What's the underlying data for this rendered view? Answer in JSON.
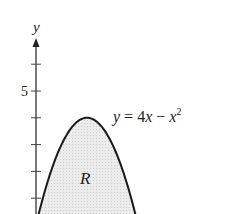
{
  "chart_data": {
    "type": "area",
    "title": "",
    "xlabel": "",
    "ylabel": "y",
    "function": "y = 4x - x^2",
    "curve_label": "y = 4x − x²",
    "region_label": "R",
    "x": [
      0,
      0.5,
      1,
      1.5,
      2,
      2.5,
      3,
      3.5,
      4
    ],
    "y": [
      0,
      1.75,
      3,
      3.75,
      4,
      3.75,
      3,
      1.75,
      0
    ],
    "y_ticks": [
      1,
      2,
      3,
      4,
      5,
      6
    ],
    "y_tick_labels": [
      {
        "value": 5,
        "label": "5"
      }
    ],
    "ylim": [
      0,
      6.5
    ],
    "xlim": [
      0,
      4
    ],
    "grid": false,
    "legend": null,
    "fill_color": "#e6e6e6",
    "line_color": "#1a1a1a"
  },
  "labels": {
    "y_axis": "y",
    "tick_5": "5",
    "curve": "y = 4x − x",
    "curve_exp": "2",
    "region": "R"
  }
}
